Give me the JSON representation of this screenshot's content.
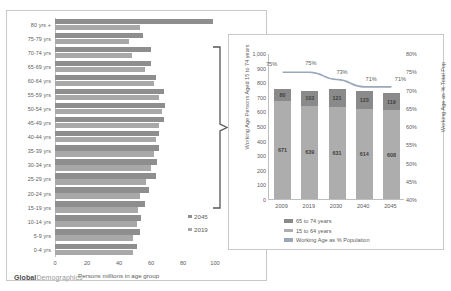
{
  "footer": {
    "brand_bold": "Global",
    "brand_light": "Demographics"
  },
  "chart_data": [
    {
      "type": "bar",
      "orientation": "horizontal",
      "title": "",
      "xlabel": "Persons millions in age group",
      "ylabel": "",
      "xlim": [
        0,
        100
      ],
      "xticks": [
        "0",
        "20",
        "40",
        "60",
        "80",
        "100"
      ],
      "grid": false,
      "legend_position": "inside-right",
      "categories": [
        "80 yrs +",
        "75-79 yrs",
        "70-74 yrs",
        "65-69 yrs",
        "60-64 yrs",
        "55-59 yrs",
        "50-54 yrs",
        "45-49 yrs",
        "40-44 yrs",
        "35-39 yrs",
        "30-34 yrs",
        "25-29 yrs",
        "20-24 yrs",
        "15-19 yrs",
        "10-14 yrs",
        "5-9 yrs",
        "0-4 yrs"
      ],
      "series": [
        {
          "name": "2045",
          "color": "#8e8e8e",
          "values": [
            99,
            55,
            60,
            60,
            63,
            68,
            69,
            68,
            65,
            65,
            64,
            63,
            59,
            56,
            54,
            53,
            51
          ]
        },
        {
          "name": "2019",
          "color": "#a8a8a8",
          "values": [
            53,
            46,
            48,
            56,
            62,
            65,
            67,
            65,
            63,
            62,
            60,
            57,
            53,
            52,
            51,
            49,
            49
          ]
        }
      ],
      "annotation_bracket": {
        "from": "70-74 yrs",
        "to": "15-19 yrs"
      }
    },
    {
      "type": "bar",
      "subtype": "stacked-column-with-line",
      "title": "",
      "xlabel": "",
      "ylabel": "Working Age Persons Aged 15 to 74 years",
      "y2label": "Working Age as % Total Pop",
      "ylim": [
        0,
        1000
      ],
      "yticks": [
        "1,000",
        "900",
        "800",
        "700",
        "600",
        "500",
        "400",
        "300",
        "200",
        "100",
        "0"
      ],
      "y2lim": [
        40,
        80
      ],
      "y2ticks": [
        "80%",
        "75%",
        "70%",
        "65%",
        "60%",
        "55%",
        "50%",
        "45%",
        "40%"
      ],
      "grid": false,
      "legend_position": "bottom",
      "categories": [
        "2009",
        "2019",
        "2030",
        "2040",
        "2045"
      ],
      "series": [
        {
          "name": "15 to 64 years",
          "color": "#adadad",
          "values": [
            671,
            639,
            631,
            614,
            608
          ]
        },
        {
          "name": "65 to 74 years",
          "color": "#8a8a8a",
          "values": [
            80,
            103,
            121,
            123,
            119
          ]
        }
      ],
      "line_series": {
        "name": "Working Age as % Population",
        "color": "#9aa8b8",
        "values": [
          75,
          75,
          73,
          71,
          71
        ],
        "labels": [
          "75%",
          "75%",
          "73%",
          "71%",
          "71%"
        ]
      },
      "legend_entries": [
        "65 to 74 years",
        "15 to 64 years",
        "Working Age as % Population"
      ]
    }
  ]
}
